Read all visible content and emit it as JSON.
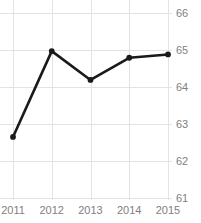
{
  "chart_data": {
    "type": "line",
    "title": "Freedom Trend",
    "xlabel": "",
    "ylabel": "",
    "categories": [
      "2011",
      "2012",
      "2013",
      "2014",
      "2015"
    ],
    "x": [
      2011,
      2012,
      2013,
      2014,
      2015
    ],
    "values": [
      62.65,
      64.97,
      64.19,
      64.79,
      64.88
    ],
    "series": [
      {
        "name": "Freedom Score",
        "values": [
          62.65,
          64.97,
          64.19,
          64.79,
          64.88
        ]
      }
    ],
    "ylim": [
      61,
      66
    ],
    "xlim": [
      2011,
      2015
    ],
    "y_ticks": [
      66,
      65,
      64,
      63,
      62,
      61
    ],
    "y_tick_labels": [
      "66",
      "65",
      "64",
      "63",
      "62",
      "61"
    ],
    "x_ticks": [
      2011,
      2012,
      2013,
      2014,
      2015
    ],
    "x_tick_labels": [
      "2011",
      "2012",
      "2013",
      "2014",
      "2015"
    ],
    "y_axis_position": "right",
    "grid": true,
    "grid_axis": "both",
    "legend": false,
    "legend_position": "none",
    "markers": "circle",
    "colors": {
      "line": "#1a1a1a",
      "marker": "#1a1a1a",
      "grid": "#e3e3e3",
      "tick_label": "#808080",
      "title": "#1a1a1a",
      "background": "#ffffff"
    }
  }
}
